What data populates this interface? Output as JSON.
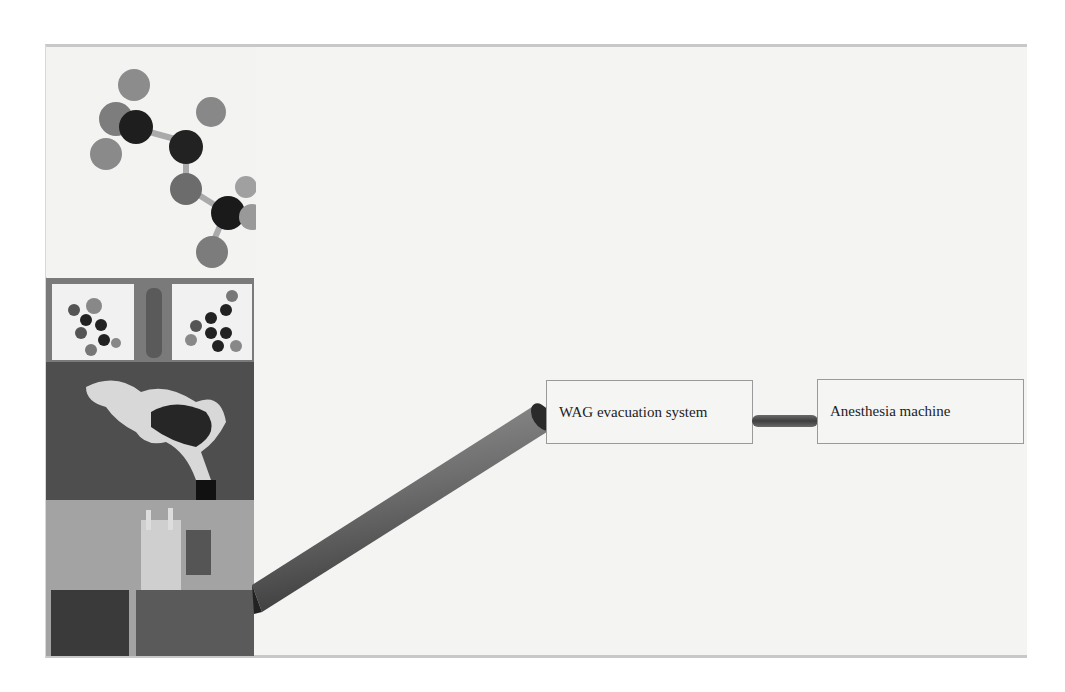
{
  "diagram": {
    "nodes": [
      {
        "id": "wag",
        "label": "WAG evacuation system"
      },
      {
        "id": "anesthesia",
        "label": "Anesthesia machine"
      }
    ],
    "edges": [
      {
        "from": "images",
        "to": "wag",
        "type": "tube"
      },
      {
        "from": "wag",
        "to": "anesthesia",
        "type": "short-tube"
      }
    ],
    "images": [
      {
        "name": "molecule-model",
        "description": "ball-and-stick molecule model"
      },
      {
        "name": "molecular-structures",
        "description": "two molecule models with a gas cylinder between"
      },
      {
        "name": "smokestack",
        "description": "smokestack emitting smoke"
      },
      {
        "name": "city-buildings",
        "description": "gothic tower and buildings"
      }
    ]
  }
}
